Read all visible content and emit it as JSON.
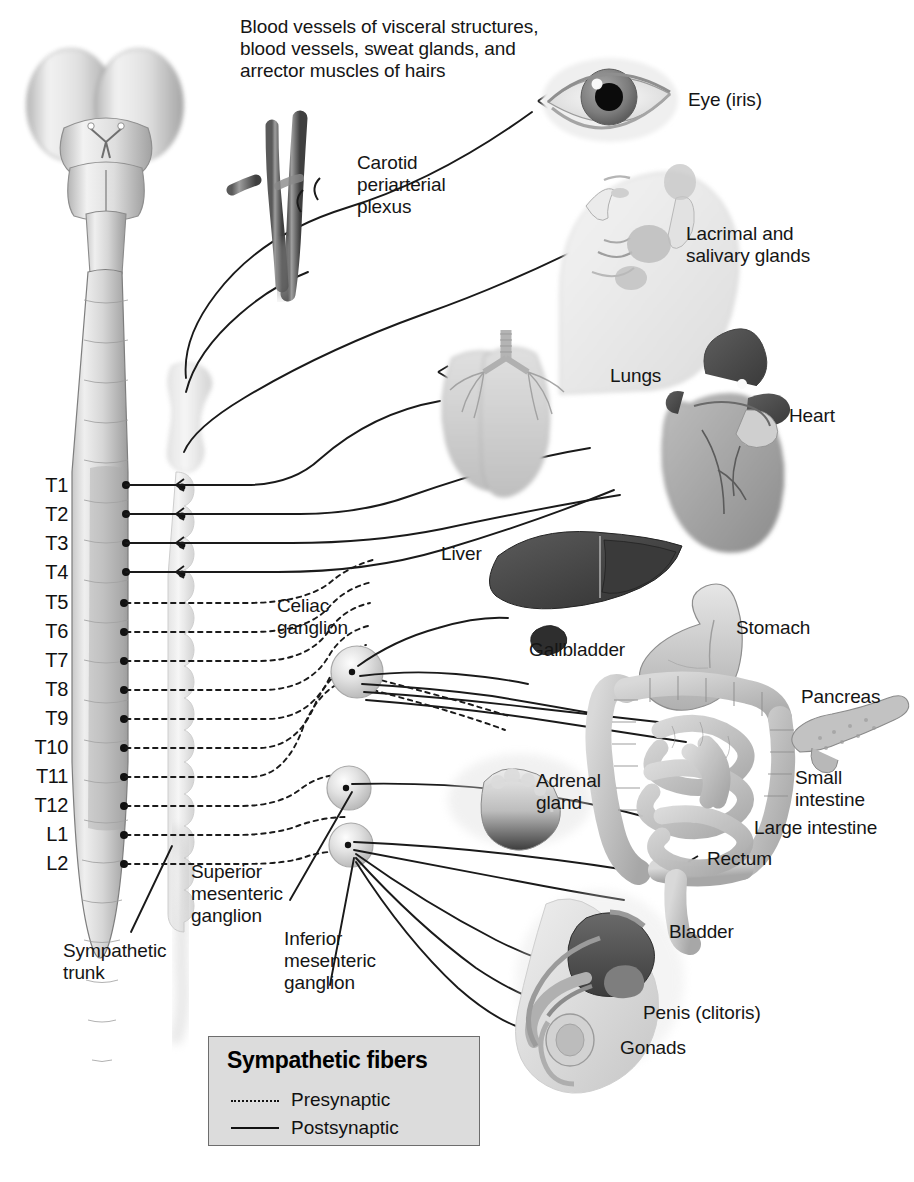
{
  "figure": {
    "intro_note": "Blood vessels of visceral structures,\nblood vessels, sweat glands, and\narrector muscles of hairs"
  },
  "legend": {
    "title": "Sympathetic fibers",
    "items": [
      {
        "label": "Presynaptic",
        "style": "dotted"
      },
      {
        "label": "Postsynaptic",
        "style": "solid"
      }
    ]
  },
  "spinal_levels": [
    {
      "label": "T1",
      "fiber": "postsynaptic"
    },
    {
      "label": "T2",
      "fiber": "postsynaptic"
    },
    {
      "label": "T3",
      "fiber": "postsynaptic"
    },
    {
      "label": "T4",
      "fiber": "postsynaptic"
    },
    {
      "label": "T5",
      "fiber": "presynaptic"
    },
    {
      "label": "T6",
      "fiber": "presynaptic"
    },
    {
      "label": "T7",
      "fiber": "presynaptic"
    },
    {
      "label": "T8",
      "fiber": "presynaptic"
    },
    {
      "label": "T9",
      "fiber": "presynaptic"
    },
    {
      "label": "T10",
      "fiber": "presynaptic"
    },
    {
      "label": "T11",
      "fiber": "presynaptic"
    },
    {
      "label": "T12",
      "fiber": "presynaptic"
    },
    {
      "label": "L1",
      "fiber": "presynaptic"
    },
    {
      "label": "L2",
      "fiber": "presynaptic"
    }
  ],
  "structures": {
    "carotid_plexus": "Carotid\nperiarterial\nplexus",
    "sympathetic_trunk": "Sympathetic\ntrunk",
    "celiac_ganglion": "Celiac\nganglion",
    "superior_mesenteric_ganglion": "Superior\nmesenteric\nganglion",
    "inferior_mesenteric_ganglion": "Inferior\nmesenteric\nganglion"
  },
  "organs": [
    {
      "name": "eye",
      "label": "Eye (iris)"
    },
    {
      "name": "lacrimal",
      "label": "Lacrimal and\nsalivary glands"
    },
    {
      "name": "lungs",
      "label": "Lungs"
    },
    {
      "name": "heart",
      "label": "Heart"
    },
    {
      "name": "liver",
      "label": "Liver"
    },
    {
      "name": "gallbladder",
      "label": "Gallbladder"
    },
    {
      "name": "stomach",
      "label": "Stomach"
    },
    {
      "name": "pancreas",
      "label": "Pancreas"
    },
    {
      "name": "adrenal",
      "label": "Adrenal\ngland"
    },
    {
      "name": "small-intestine",
      "label": "Small\nintestine"
    },
    {
      "name": "large-intestine",
      "label": "Large intestine"
    },
    {
      "name": "rectum",
      "label": "Rectum"
    },
    {
      "name": "bladder",
      "label": "Bladder"
    },
    {
      "name": "penis",
      "label": "Penis (clitoris)"
    },
    {
      "name": "gonads",
      "label": "Gonads"
    }
  ],
  "colors": {
    "ink": "#151515",
    "legend_bg": "#dcdcdc",
    "legend_border": "#6d6d6d",
    "tissue_light": "#e8e8e8",
    "tissue_mid": "#b8b8b8",
    "tissue_dark": "#6a6a6a",
    "organ_dark": "#4a4a4a"
  }
}
